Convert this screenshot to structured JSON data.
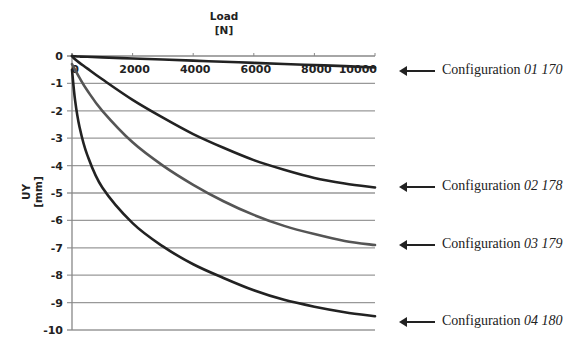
{
  "chart_data": {
    "type": "line",
    "title": "",
    "xlabel": "Load [N]",
    "xlabel_lines": [
      "Load",
      "[N]"
    ],
    "ylabel": "UY [mm]",
    "ylabel_lines": [
      "UY",
      "[mm]"
    ],
    "xlim": [
      0,
      10000
    ],
    "ylim": [
      -10,
      0
    ],
    "x_ticks": [
      0,
      2000,
      4000,
      6000,
      8000,
      10000
    ],
    "y_ticks": [
      0,
      -1,
      -2,
      -3,
      -4,
      -5,
      -6,
      -7,
      -8,
      -9,
      -10
    ],
    "x_tick_labels": [
      "0",
      "2000",
      "4000",
      "6000",
      "8000",
      "10000"
    ],
    "y_tick_labels": [
      "0",
      "-1",
      "-2",
      "-3",
      "-4",
      "-5",
      "-6",
      "-7",
      "-8",
      "-9",
      "-10"
    ],
    "grid": "horizontal",
    "x_axis_position": "top",
    "legend": "annotations-right",
    "x": [
      0,
      100,
      250,
      500,
      1000,
      2000,
      3000,
      4000,
      5000,
      6000,
      7000,
      8000,
      9000,
      10000
    ],
    "series": [
      {
        "name": "Configuration 01 170",
        "color": "#222222",
        "values": [
          0,
          -0.01,
          -0.02,
          -0.03,
          -0.05,
          -0.09,
          -0.13,
          -0.17,
          -0.21,
          -0.25,
          -0.29,
          -0.33,
          -0.37,
          -0.42
        ]
      },
      {
        "name": "Configuration 02 178",
        "color": "#222222",
        "values": [
          0,
          -0.12,
          -0.25,
          -0.45,
          -0.85,
          -1.6,
          -2.25,
          -2.85,
          -3.35,
          -3.8,
          -4.15,
          -4.45,
          -4.65,
          -4.8
        ]
      },
      {
        "name": "Configuration 03 179",
        "color": "#555555",
        "values": [
          -0.3,
          -0.5,
          -0.8,
          -1.25,
          -2.0,
          -3.15,
          -4.0,
          -4.7,
          -5.3,
          -5.8,
          -6.2,
          -6.5,
          -6.75,
          -6.9
        ]
      },
      {
        "name": "Configuration 04 180",
        "color": "#222222",
        "values": [
          -0.5,
          -1.6,
          -2.6,
          -3.6,
          -4.8,
          -6.1,
          -6.95,
          -7.6,
          -8.1,
          -8.55,
          -8.9,
          -9.15,
          -9.35,
          -9.5
        ]
      }
    ]
  },
  "annotations": [
    {
      "prefix": "Configuration ",
      "id": "01 170"
    },
    {
      "prefix": "Configuration ",
      "id": "02 178"
    },
    {
      "prefix": "Configuration ",
      "id": "03 179"
    },
    {
      "prefix": "Configuration ",
      "id": "04 180"
    }
  ]
}
